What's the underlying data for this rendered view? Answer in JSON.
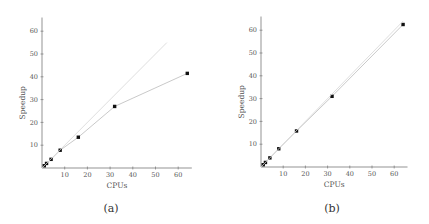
{
  "chart_data": [
    {
      "type": "line",
      "panel": "(a)",
      "xlabel": "CPUs",
      "ylabel": "Speedup",
      "xlim": [
        0,
        66
      ],
      "ylim": [
        0,
        66
      ],
      "xticks": [
        10,
        20,
        30,
        40,
        50,
        60
      ],
      "yticks": [
        10,
        20,
        30,
        40,
        50,
        60
      ],
      "grid": false,
      "series": [
        {
          "name": "measured",
          "x": [
            1,
            2,
            4,
            8,
            16,
            32,
            64
          ],
          "y": [
            1,
            2,
            3.8,
            7.8,
            13.5,
            27,
            41.5
          ],
          "marker": "square"
        },
        {
          "name": "ideal",
          "x": [
            0,
            55
          ],
          "y": [
            0,
            55
          ],
          "style": "faint-line"
        }
      ]
    },
    {
      "type": "line",
      "panel": "(b)",
      "xlabel": "CPUs",
      "ylabel": "Speedup",
      "xlim": [
        0,
        66
      ],
      "ylim": [
        0,
        66
      ],
      "xticks": [
        10,
        20,
        30,
        40,
        50,
        60
      ],
      "yticks": [
        10,
        20,
        30,
        40,
        50,
        60
      ],
      "grid": false,
      "series": [
        {
          "name": "measured",
          "x": [
            1,
            2,
            4,
            8,
            16,
            32,
            64
          ],
          "y": [
            1,
            2,
            4,
            8,
            15.8,
            31,
            62.5
          ],
          "marker": "square"
        },
        {
          "name": "ideal",
          "x": [
            0,
            64
          ],
          "y": [
            0,
            64
          ],
          "style": "faint-line"
        }
      ]
    }
  ],
  "captions": [
    "(a)",
    "(b)"
  ],
  "labels": {
    "x": "CPUs",
    "y": "Speedup"
  }
}
